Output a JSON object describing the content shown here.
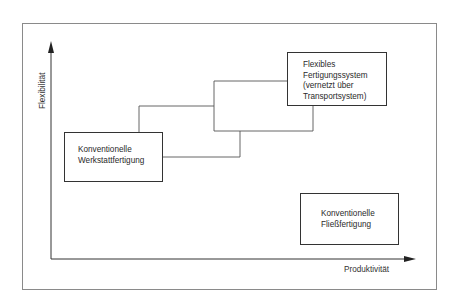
{
  "diagram": {
    "type": "positioning-diagram",
    "axes": {
      "x_label": "Produktivität",
      "y_label": "Flexibilität"
    },
    "boxes": [
      {
        "id": "werkstatt",
        "lines": [
          "Konventionelle",
          "Werkstattfertigung"
        ]
      },
      {
        "id": "fms",
        "lines": [
          "Flexibles",
          "Fertigungssystem",
          "(vernetzt über",
          "Transportsystem)"
        ]
      },
      {
        "id": "fliess",
        "lines": [
          "Konventionelle",
          "Fließfertigung"
        ]
      }
    ],
    "connections": [
      {
        "from": "werkstatt",
        "to": "fms",
        "shape": "stepped-parallelogram"
      }
    ],
    "colors": {
      "line": "#333333",
      "frame": "#8a8a8a",
      "background": "#ffffff"
    }
  }
}
